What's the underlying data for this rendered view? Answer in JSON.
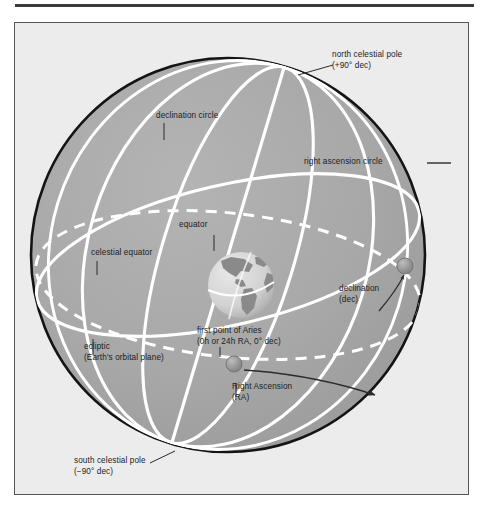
{
  "figure": {
    "title_alt": "Celestial sphere coordinate diagram",
    "panel": {
      "background_color": "#ececec",
      "border_color": "#555555"
    },
    "sphere": {
      "fill_color": "#a8a8a8",
      "outline_color": "#141414",
      "center_x": 213,
      "center_y": 232,
      "radius": 198
    },
    "colors": {
      "great_circle": "#ffffff",
      "ecliptic_dashed": "#ffffff",
      "leader_line": "#2b2b2b",
      "marker": "#8f8f8f",
      "earth_ocean": "#dcdcdc",
      "earth_land": "#8a8a8a",
      "text": "#1c1c1c"
    },
    "labels": [
      {
        "name": "north-celestial-pole",
        "lines": [
          "north celestial pole",
          "(+90° dec)"
        ],
        "x": 331,
        "y": 49
      },
      {
        "name": "declination-circle",
        "lines": [
          "declination circle"
        ],
        "x": 155,
        "y": 110
      },
      {
        "name": "right-ascension-circle",
        "lines": [
          "right ascension circle"
        ],
        "x": 303,
        "y": 156
      },
      {
        "name": "equator",
        "lines": [
          "equator"
        ],
        "x": 178,
        "y": 219
      },
      {
        "name": "celestial-equator",
        "lines": [
          "celestial equator"
        ],
        "x": 90,
        "y": 247
      },
      {
        "name": "declination-dec",
        "lines": [
          "declination",
          "(dec)"
        ],
        "x": 338,
        "y": 283
      },
      {
        "name": "ecliptic",
        "lines": [
          "ecliptic",
          "(Earth's orbital plane)"
        ],
        "x": 83,
        "y": 341
      },
      {
        "name": "first-point-of-aries",
        "lines": [
          "first point of Aries",
          "(0h or 24h RA, 0° dec)"
        ],
        "x": 196,
        "y": 325
      },
      {
        "name": "right-ascension",
        "lines": [
          "Right Ascension",
          "(RA)"
        ],
        "x": 231,
        "y": 381
      },
      {
        "name": "south-celestial-pole",
        "lines": [
          "south celestial pole",
          "(−90° dec)"
        ],
        "x": 73,
        "y": 455
      }
    ]
  }
}
